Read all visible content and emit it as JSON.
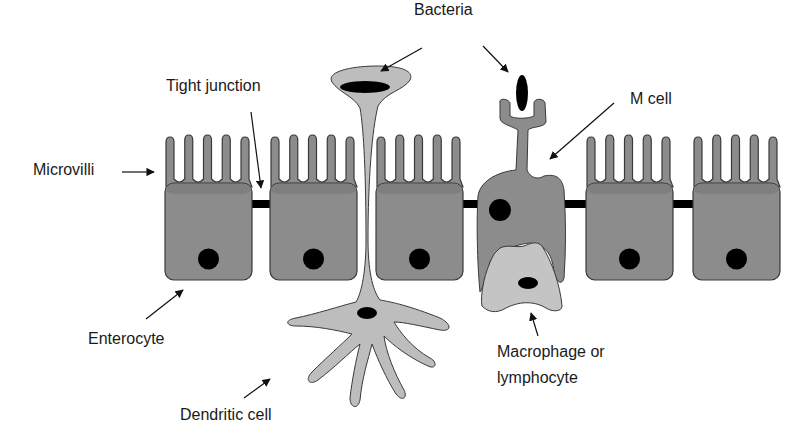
{
  "labels": {
    "bacteria": "Bacteria",
    "tight_junction": "Tight junction",
    "m_cell": "M cell",
    "microvilli": "Microvilli",
    "enterocyte": "Enterocyte",
    "dendritic_cell": "Dendritic cell",
    "macrophage_line1": "Macrophage or",
    "macrophage_line2": "lymphocyte"
  },
  "colors": {
    "enterocyte": "#8c8c8c",
    "enterocyte_top": "#7f7f7f",
    "dendritic": "#bdbdbd",
    "macrophage": "#c4c4c4",
    "nucleus": "#000000",
    "outline": "#3a3a3a",
    "junction": "#000000"
  }
}
